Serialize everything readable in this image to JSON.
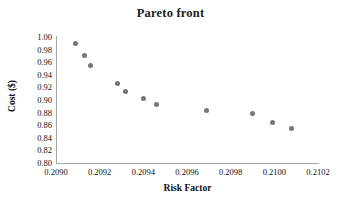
{
  "chart_data": {
    "type": "scatter",
    "title": "Pareto front",
    "xlabel": "Risk Factor",
    "ylabel": "Cost ($)",
    "xlim": [
      0.209,
      0.2102
    ],
    "ylim": [
      0.8,
      1.0
    ],
    "grid": false,
    "legend": null,
    "marker_color": "#767676",
    "axis_color": "#a6a6a6",
    "xticks": [
      "0.2090",
      "0.2092",
      "0.2094",
      "0.2096",
      "0.2098",
      "0.2100",
      "0.2102"
    ],
    "xtick_values": [
      0.209,
      0.2092,
      0.2094,
      0.2096,
      0.2098,
      0.21,
      0.2102
    ],
    "yticks": [
      "0.80",
      "0.82",
      "0.84",
      "0.86",
      "0.88",
      "0.90",
      "0.92",
      "0.94",
      "0.96",
      "0.98",
      "1.00"
    ],
    "ytick_values": [
      0.8,
      0.82,
      0.84,
      0.86,
      0.88,
      0.9,
      0.92,
      0.94,
      0.96,
      0.98,
      1.0
    ],
    "series": [
      {
        "name": "Pareto front",
        "x": [
          0.20909,
          0.20913,
          0.20916,
          0.20928,
          0.20932,
          0.2094,
          0.20946,
          0.20969,
          0.2099,
          0.20999,
          0.21008
        ],
        "y": [
          0.989,
          0.97,
          0.954,
          0.926,
          0.913,
          0.902,
          0.893,
          0.884,
          0.879,
          0.864,
          0.855
        ]
      }
    ]
  }
}
